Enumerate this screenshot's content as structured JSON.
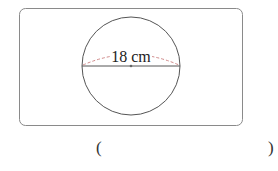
{
  "figure": {
    "type": "circle-diameter",
    "label": "18 cm",
    "diameter_value": 18,
    "unit": "cm",
    "colors": {
      "frame": "#8a8a8a",
      "circle": "#555555",
      "diameter_line": "#555555",
      "dashed_arc": "#d08a8a",
      "label": "#222222"
    }
  },
  "answer": {
    "open_paren": "(",
    "close_paren": ")",
    "value": ""
  }
}
